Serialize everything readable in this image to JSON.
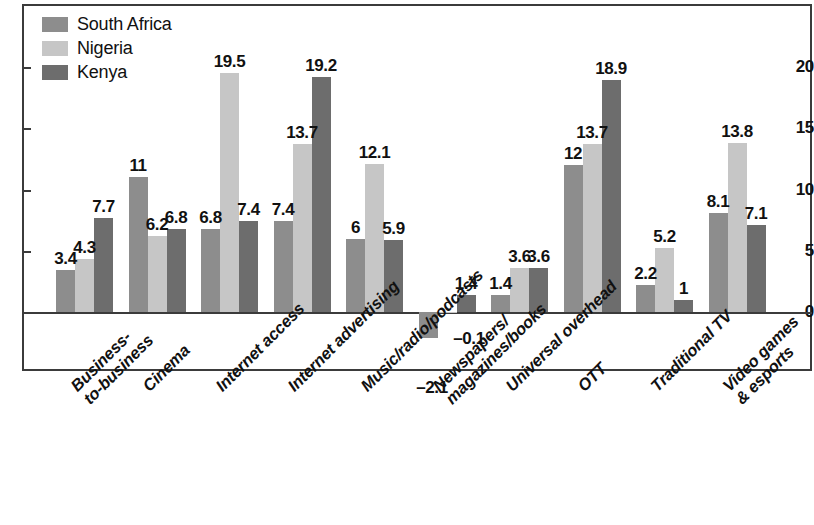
{
  "chart_data": {
    "type": "bar",
    "title": "",
    "subtitle": "",
    "xlabel": "",
    "ylabel": "",
    "ylim": [
      -3,
      21.5
    ],
    "yticks": [
      0,
      5,
      10,
      15,
      20
    ],
    "ytick_labels": [
      "0",
      "5",
      "10",
      "15",
      "20"
    ],
    "grid": false,
    "legend_position": "top-left",
    "orientation": "vertical",
    "categories": [
      "Business-to-business",
      "Cinema",
      "Internet access",
      "Internet advertising",
      "Music/radio/podcasts",
      "Newspapers/magazines/books",
      "Universal overhead",
      "OTT",
      "Traditional TV",
      "Video games & esports"
    ],
    "category_label_lines": [
      [
        "Business-",
        "to-business"
      ],
      [
        "Cinema"
      ],
      [
        "Internet access"
      ],
      [
        "Internet advertising"
      ],
      [
        "Music/radio/podcasts"
      ],
      [
        "Newspapers/",
        "magazines/books"
      ],
      [
        "Universal overhead"
      ],
      [
        "OTT"
      ],
      [
        "Traditional TV"
      ],
      [
        "Video games",
        "& esports"
      ]
    ],
    "series": [
      {
        "name": "South Africa",
        "color": "#8d8d8d",
        "values": [
          3.4,
          11,
          6.8,
          7.4,
          6,
          -2.1,
          1.4,
          12,
          2.2,
          8.1
        ],
        "value_labels": [
          "3.4",
          "11",
          "6.8",
          "7.4",
          "6",
          "–2.1",
          "1.4",
          "12",
          "2.2",
          "8.1"
        ]
      },
      {
        "name": "Nigeria",
        "color": "#c6c6c6",
        "values": [
          4.3,
          6.2,
          19.5,
          13.7,
          12.1,
          -0.1,
          3.6,
          13.7,
          5.2,
          13.8
        ],
        "value_labels": [
          "4.3",
          "6.2",
          "19.5",
          "13.7",
          "12.1",
          "–0.1",
          "3.6",
          "13.7",
          "5.2",
          "13.8"
        ]
      },
      {
        "name": "Kenya",
        "color": "#6d6d6d",
        "values": [
          7.7,
          6.8,
          7.4,
          19.2,
          5.9,
          1.4,
          3.6,
          18.9,
          1,
          7.1
        ],
        "value_labels": [
          "7.7",
          "6.8",
          "7.4",
          "19.2",
          "5.9",
          "1.4",
          "3.6",
          "18.9",
          "1",
          "7.1"
        ]
      }
    ]
  },
  "legend": {
    "items": [
      {
        "label": "South Africa",
        "color": "#8d8d8d"
      },
      {
        "label": "Nigeria",
        "color": "#c6c6c6"
      },
      {
        "label": "Kenya",
        "color": "#6d6d6d"
      }
    ]
  },
  "axis": {
    "y_tick_labels": [
      "20",
      "15",
      "10",
      "5",
      "0"
    ]
  }
}
